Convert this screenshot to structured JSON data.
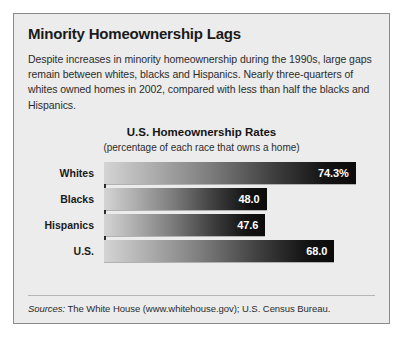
{
  "headline": "Minority Homeownership Lags",
  "deck": "Despite increases in minority homeownership during the 1990s, large gaps remain between whites, blacks and Hispanics. Nearly three-quarters of whites owned homes in 2002, compared with less than half the blacks and Hispanics.",
  "sources": {
    "lead": "Sources:",
    "text": " The White House (www.whitehouse.gov); U.S. Census Bureau."
  },
  "colors": {
    "panel_background": "#ececec",
    "panel_border": "#8a8a8a",
    "bar_light": "#d4d4d4",
    "bar_dark": "#0b0b0b",
    "value_text": "#ffffff",
    "axis": "#2e2e2e"
  },
  "chart_data": {
    "type": "bar",
    "orientation": "horizontal",
    "title": "U.S. Homeownership Rates",
    "subtitle": "(percentage of each race that owns a home)",
    "xlabel": "",
    "ylabel": "",
    "xlim": [
      0,
      80
    ],
    "grid": false,
    "legend": "none",
    "categories": [
      "Whites",
      "Blacks",
      "Hispanics",
      "U.S."
    ],
    "values": [
      74.3,
      48.0,
      47.6,
      68.0
    ],
    "value_labels": [
      "74.3%",
      "48.0",
      "47.6",
      "68.0"
    ]
  }
}
